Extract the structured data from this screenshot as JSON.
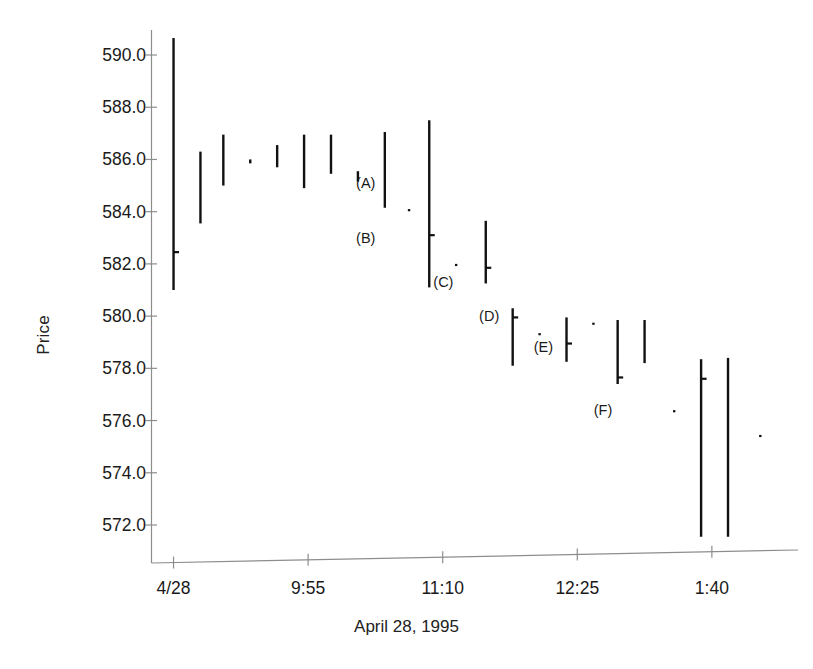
{
  "chart_data": {
    "type": "bar",
    "subtype": "hlc-price-bar",
    "title": "",
    "xlabel": "April 28, 1995",
    "ylabel": "Price",
    "ylim": [
      571.0,
      591.2
    ],
    "yticks": [
      572.0,
      574.0,
      576.0,
      578.0,
      580.0,
      582.0,
      584.0,
      586.0,
      588.0,
      590.0
    ],
    "ytick_labels": [
      "572.0",
      "574.0",
      "576.0",
      "578.0",
      "580.0",
      "582.0",
      "584.0",
      "586.0",
      "588.0",
      "590.0"
    ],
    "xticks": [
      1,
      6,
      11,
      16,
      21
    ],
    "xtick_labels": [
      "4/28",
      "9:55",
      "11:10",
      "12:25",
      "1:40"
    ],
    "xlim": [
      0.2,
      24.2
    ],
    "grid": false,
    "legend": null,
    "series": [
      {
        "name": "Price bars (high-low-close)",
        "color": "#111111",
        "bars": [
          {
            "x": 1.0,
            "high": 590.65,
            "low": 581.0,
            "close": 582.45
          },
          {
            "x": 2.0,
            "high": 586.3,
            "low": 583.55,
            "close": null
          },
          {
            "x": 2.85,
            "high": 586.95,
            "low": 585.0,
            "close": null
          },
          {
            "x": 3.85,
            "high": 586.0,
            "low": 585.85,
            "close": null
          },
          {
            "x": 4.85,
            "high": 586.55,
            "low": 585.7,
            "close": null
          },
          {
            "x": 5.85,
            "high": 586.95,
            "low": 584.9,
            "close": null
          },
          {
            "x": 6.85,
            "high": 586.95,
            "low": 585.45,
            "close": null
          },
          {
            "x": 7.85,
            "high": 585.55,
            "low": 585.15,
            "close": null
          },
          {
            "x": 8.85,
            "high": 587.05,
            "low": 584.15,
            "close": null
          },
          {
            "x": 9.75,
            "high": 584.1,
            "low": 584.05,
            "close": null
          },
          {
            "x": 10.5,
            "high": 587.5,
            "low": 581.1,
            "close": 583.1
          },
          {
            "x": 11.5,
            "high": 582.0,
            "low": 581.95,
            "close": null
          },
          {
            "x": 12.6,
            "high": 583.65,
            "low": 581.25,
            "close": 581.85
          },
          {
            "x": 13.6,
            "high": 580.3,
            "low": 578.1,
            "close": 579.95
          },
          {
            "x": 14.6,
            "high": 579.35,
            "low": 579.3,
            "close": null
          },
          {
            "x": 15.6,
            "high": 579.95,
            "low": 578.25,
            "close": 578.95
          },
          {
            "x": 16.6,
            "high": 579.75,
            "low": 579.7,
            "close": null
          },
          {
            "x": 17.5,
            "high": 579.85,
            "low": 577.4,
            "close": 577.65
          },
          {
            "x": 18.5,
            "high": 579.85,
            "low": 578.2,
            "close": null
          },
          {
            "x": 19.6,
            "high": 576.4,
            "low": 576.35,
            "close": null
          },
          {
            "x": 20.6,
            "high": 578.35,
            "low": 571.55,
            "close": 577.6
          },
          {
            "x": 21.6,
            "high": 578.4,
            "low": 571.55,
            "close": null
          },
          {
            "x": 22.8,
            "high": 575.45,
            "low": 575.4,
            "close": null
          }
        ]
      }
    ],
    "annotations": [
      {
        "label": "(A)",
        "x": 8.5,
        "y": 585.1
      },
      {
        "label": "(B)",
        "x": 8.5,
        "y": 583.0
      },
      {
        "label": "(C)",
        "x": 11.4,
        "y": 581.3
      },
      {
        "label": "(D)",
        "x": 13.1,
        "y": 580.0
      },
      {
        "label": "(E)",
        "x": 15.1,
        "y": 578.8
      },
      {
        "label": "(F)",
        "x": 17.3,
        "y": 576.4
      }
    ]
  },
  "axes": {
    "y_title": "Price",
    "x_title": "April 28, 1995"
  }
}
